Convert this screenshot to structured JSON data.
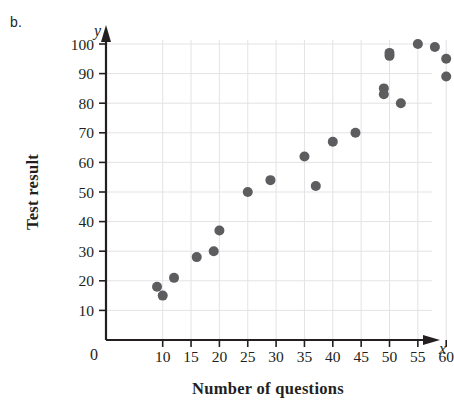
{
  "panel": {
    "label": "b."
  },
  "chart_data": {
    "type": "scatter",
    "title": "",
    "xlabel": "Number of questions",
    "ylabel": "Test result",
    "x_axis_symbol": "x",
    "y_axis_symbol": "y",
    "origin_label": "0",
    "grid": true,
    "legend": "none",
    "xlim": [
      0,
      63
    ],
    "ylim": [
      0,
      104
    ],
    "xticks": [
      10,
      15,
      20,
      25,
      30,
      35,
      40,
      45,
      50,
      55,
      60
    ],
    "xtick_labels": [
      "10",
      "15",
      "20",
      "25",
      "30",
      "35",
      "40",
      "45",
      "50",
      "55",
      "60"
    ],
    "yticks": [
      10,
      20,
      30,
      40,
      50,
      60,
      70,
      80,
      90,
      100
    ],
    "ytick_labels": [
      "10",
      "20",
      "30",
      "40",
      "50",
      "60",
      "70",
      "80",
      "90",
      "100"
    ],
    "marker_color": "#5d5d60",
    "marker_radius": 5,
    "points": [
      {
        "x": 9,
        "y": 18
      },
      {
        "x": 10,
        "y": 15
      },
      {
        "x": 12,
        "y": 21
      },
      {
        "x": 16,
        "y": 28
      },
      {
        "x": 19,
        "y": 30
      },
      {
        "x": 20,
        "y": 37
      },
      {
        "x": 25,
        "y": 50
      },
      {
        "x": 29,
        "y": 54
      },
      {
        "x": 35,
        "y": 62
      },
      {
        "x": 37,
        "y": 52
      },
      {
        "x": 40,
        "y": 67
      },
      {
        "x": 44,
        "y": 70
      },
      {
        "x": 49,
        "y": 85
      },
      {
        "x": 49,
        "y": 83
      },
      {
        "x": 50,
        "y": 97
      },
      {
        "x": 50,
        "y": 96
      },
      {
        "x": 52,
        "y": 80
      },
      {
        "x": 55,
        "y": 100
      },
      {
        "x": 58,
        "y": 99
      },
      {
        "x": 60,
        "y": 95
      },
      {
        "x": 60,
        "y": 89
      }
    ]
  },
  "colors": {
    "marker": "#5d5d60",
    "axis": "#231f20",
    "grid": "#e3e3e6",
    "background": "#ffffff"
  }
}
